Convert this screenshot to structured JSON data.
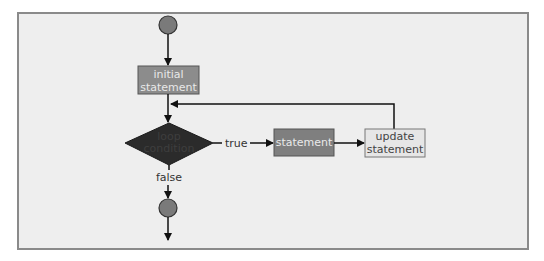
{
  "diagram": {
    "type": "flowchart",
    "nodes": {
      "start": {
        "shape": "circle"
      },
      "initial": {
        "shape": "rect",
        "line1": "initial",
        "line2": "statement"
      },
      "condition": {
        "shape": "diamond",
        "line1": "loop",
        "line2": "condition"
      },
      "statement": {
        "shape": "rect",
        "label": "statement"
      },
      "update": {
        "shape": "rect",
        "line1": "update",
        "line2": "statement"
      },
      "end": {
        "shape": "circle"
      }
    },
    "edges": {
      "true_label": "true",
      "false_label": "false"
    },
    "colors": {
      "frame_bg": "#eeeeee",
      "frame_border": "#8a8a8a",
      "circle_fill": "#7a7a7a",
      "initial_fill": "#8c8c8c",
      "diamond_fill": "#2b2b2b",
      "statement_fill": "#7f7f7f",
      "update_fill": "#e6e6e6",
      "line": "#111111"
    }
  }
}
